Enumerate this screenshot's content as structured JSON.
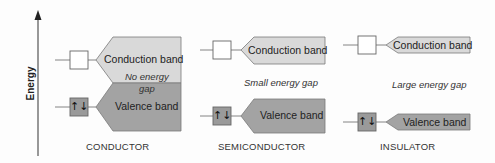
{
  "axis": {
    "label": "Energy"
  },
  "colors": {
    "conduction_fill": "#d9d9d9",
    "valence_fill": "#a3a3a3",
    "border": "#7a7a7a",
    "axis": "#555555"
  },
  "panels": [
    {
      "category": "CONDUCTOR",
      "conduction_label": "Conduction band",
      "valence_label": "Valence band",
      "gap_label_line1": "No energy",
      "gap_label_line2": "gap",
      "empty_level_icon": "empty-box",
      "filled_level_icon": "spin-pair",
      "spin_symbol": "↑↓"
    },
    {
      "category": "SEMICONDUCTOR",
      "conduction_label": "Conduction band",
      "valence_label": "Valence band",
      "gap_label": "Small energy gap",
      "spin_symbol": "↑↓"
    },
    {
      "category": "INSULATOR",
      "conduction_label": "Conduction band",
      "valence_label": "Valence band",
      "gap_label": "Large energy gap",
      "spin_symbol": "↑↓"
    }
  ]
}
